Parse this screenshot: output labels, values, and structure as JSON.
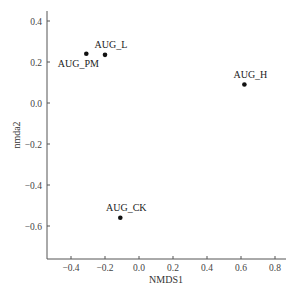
{
  "chart_data": {
    "type": "scatter",
    "title": "",
    "xlabel": "NMDS1",
    "ylabel": "nmda2",
    "xlim": [
      -0.55,
      0.86
    ],
    "ylim": [
      -0.76,
      0.45
    ],
    "grid": false,
    "legend": null,
    "x_ticks": [
      -0.4,
      -0.2,
      0.0,
      0.2,
      0.4,
      0.6,
      0.8
    ],
    "x_tick_labels": [
      "−0.4",
      "−0.2",
      "0.0",
      "0.2",
      "0.4",
      "0.6",
      "0.8"
    ],
    "y_ticks": [
      0.4,
      0.2,
      0.0,
      -0.2,
      -0.4,
      -0.6
    ],
    "y_tick_labels": [
      "0.4",
      "0.2",
      "0.0",
      "−0.2",
      "−0.4",
      "−0.6"
    ],
    "points": [
      {
        "label": "AUG_PM",
        "x": -0.31,
        "y": 0.24,
        "label_pos": "below-left"
      },
      {
        "label": "AUG_L",
        "x": -0.2,
        "y": 0.235,
        "label_pos": "above"
      },
      {
        "label": "AUG_H",
        "x": 0.62,
        "y": 0.09,
        "label_pos": "above"
      },
      {
        "label": "AUG_CK",
        "x": -0.11,
        "y": -0.56,
        "label_pos": "above"
      }
    ]
  }
}
